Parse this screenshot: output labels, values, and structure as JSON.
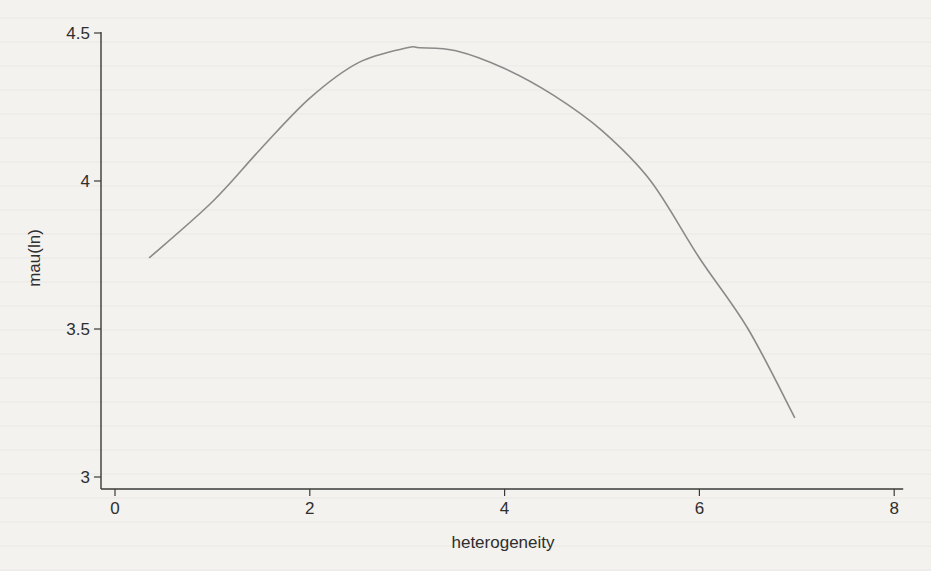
{
  "chart_data": {
    "type": "line",
    "title": "",
    "xlabel": "heterogeneity",
    "ylabel": "mau(ln)",
    "xlim": [
      0,
      8
    ],
    "ylim": [
      3,
      4.5
    ],
    "x_ticks": [
      0,
      2,
      4,
      6,
      8
    ],
    "x_tick_labels": [
      "0",
      "2",
      "4",
      "6",
      "8"
    ],
    "y_ticks": [
      3,
      3.5,
      4,
      4.5
    ],
    "y_tick_labels": [
      "3",
      "3.5",
      "4",
      "4.5"
    ],
    "grid": false,
    "legend": null,
    "series": [
      {
        "name": "fitted quadratic",
        "color": "#8a8a8a",
        "x": [
          0.35,
          1.0,
          1.5,
          2.0,
          2.5,
          3.0,
          3.13,
          3.5,
          4.0,
          4.5,
          5.0,
          5.5,
          6.0,
          6.5,
          6.98
        ],
        "y": [
          3.74,
          3.93,
          4.11,
          4.28,
          4.4,
          4.45,
          4.45,
          4.44,
          4.38,
          4.29,
          4.17,
          4.0,
          3.74,
          3.5,
          3.2
        ]
      }
    ]
  },
  "axes": {
    "xlabel": "heterogeneity",
    "ylabel": "mau(ln)"
  },
  "colors": {
    "axis": "#3a3a3a",
    "curve": "#8a8a8a",
    "background": "#f3f2ef"
  }
}
